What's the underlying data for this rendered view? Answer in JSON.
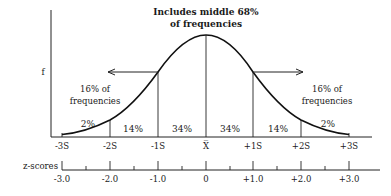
{
  "diagram": {
    "title_line1": "Includes middle 68%",
    "title_line2": "of frequencies",
    "y_axis_label": "f",
    "left_tail_label_line1": "16% of",
    "left_tail_label_line2": "frequencies",
    "right_tail_label_line1": "16% of",
    "right_tail_label_line2": "frequencies",
    "segments": [
      {
        "label": "2%",
        "from": "-3S",
        "to": "-2S"
      },
      {
        "label": "14%",
        "from": "-2S",
        "to": "-1S"
      },
      {
        "label": "34%",
        "from": "-1S",
        "to": "X"
      },
      {
        "label": "34%",
        "from": "X",
        "to": "+1S"
      },
      {
        "label": "14%",
        "from": "+1S",
        "to": "+2S"
      },
      {
        "label": "2%",
        "from": "+2S",
        "to": "+3S"
      }
    ],
    "sd_labels": [
      "-3S",
      "-2S",
      "-1S",
      "X̅",
      "+1S",
      "+2S",
      "+3S"
    ],
    "z_axis_label": "z-scores",
    "z_labels": [
      "-3.0",
      "-2.0",
      "-1.0",
      "0",
      "+1.0",
      "+2.0",
      "+3.0"
    ],
    "colors": {
      "ink": "#1a1a1a",
      "background": "#ffffff"
    }
  }
}
